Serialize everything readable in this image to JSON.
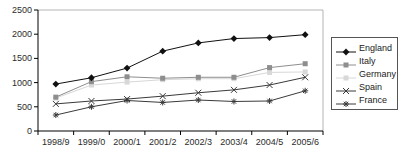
{
  "chart_data": {
    "type": "line",
    "title": "",
    "xlabel": "",
    "ylabel": "",
    "categories": [
      "1998/9",
      "1999/0",
      "2000/1",
      "2001/2",
      "2002/3",
      "2003/4",
      "2004/5",
      "2005/6"
    ],
    "series": [
      {
        "name": "England",
        "marker": "diamond",
        "color": "#111111",
        "values": [
          970,
          1100,
          1300,
          1650,
          1820,
          1910,
          1930,
          1990
        ]
      },
      {
        "name": "Italy",
        "marker": "square",
        "color": "#8e8e8e",
        "values": [
          700,
          1020,
          1120,
          1090,
          1110,
          1110,
          1310,
          1390
        ]
      },
      {
        "name": "Germany",
        "marker": "square",
        "color": "#d8d8d8",
        "values": [
          680,
          950,
          1010,
          1060,
          1080,
          1080,
          1210,
          1220
        ]
      },
      {
        "name": "Spain",
        "marker": "x",
        "color": "#3a3a3a",
        "values": [
          560,
          620,
          660,
          720,
          790,
          850,
          950,
          1110
        ]
      },
      {
        "name": "France",
        "marker": "star",
        "color": "#3a3a3a",
        "values": [
          330,
          500,
          630,
          590,
          640,
          610,
          620,
          830
        ]
      }
    ],
    "ylim": [
      0,
      2500
    ],
    "y_ticks": [
      0,
      500,
      1000,
      1500,
      2000,
      2500
    ],
    "grid": false,
    "legend_position": "right",
    "axis_color": "#000000",
    "plot_border_color": "#b4b4b4",
    "tick_label_color": "#2b2b2b"
  }
}
